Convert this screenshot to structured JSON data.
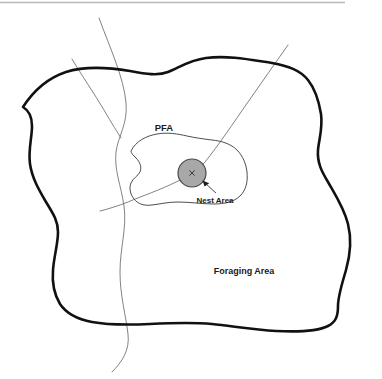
{
  "diagram": {
    "title_bar_rule": {
      "name": "top-divider-rule",
      "color": "#b9b9b9"
    },
    "background_color": "#ffffff",
    "labels": {
      "pfa": "PFA",
      "nest_area": "Nest Area",
      "foraging_area": "Foraging Area"
    },
    "regions": [
      {
        "id": "foraging-area",
        "label": "Foraging Area",
        "role": "outer-home-range-boundary",
        "stroke": "#111111",
        "stroke_width": 2.6,
        "fill": "none"
      },
      {
        "id": "pfa",
        "label": "PFA",
        "role": "post-fledging-area-boundary",
        "stroke": "#3a3a3a",
        "stroke_width": 0.9,
        "fill": "none"
      },
      {
        "id": "nest-area",
        "label": "Nest Area",
        "role": "nest-core-circle",
        "stroke": "#4a4a4a",
        "stroke_width": 1.2,
        "fill": "#a8a8a8",
        "center_x": 192,
        "center_y": 173,
        "radius": 14
      }
    ],
    "nest_center_marker": {
      "name": "nest-center-x-mark",
      "glyph": "x",
      "color": "#3a3a3a"
    },
    "leader_line": {
      "name": "nest-area-leader",
      "stroke": "#3a3a3a",
      "arrow_fill": "#1a1a1a",
      "points_to": "nest-area"
    },
    "streams": [
      {
        "id": "stream-northwest-branch",
        "stroke": "#6b6b6b",
        "stroke_width": 0.85
      },
      {
        "id": "stream-west-main",
        "stroke": "#6b6b6b",
        "stroke_width": 0.85
      },
      {
        "id": "stream-northeast-diagonal",
        "stroke": "#6b6b6b",
        "stroke_width": 0.85
      }
    ]
  }
}
